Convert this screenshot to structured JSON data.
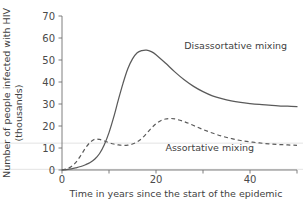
{
  "chart_data": {
    "type": "line",
    "title": "",
    "xlabel": "Time in years since the start of the epidemic",
    "ylabel": "Number of people infected with HIV (thousands)",
    "ylabel_line1": "Number of people infected with HIV",
    "ylabel_line2": "(thousands)",
    "xlim": [
      0,
      50
    ],
    "ylim": [
      0,
      70
    ],
    "xticks": [
      0,
      10,
      20,
      30,
      40,
      50
    ],
    "xtick_labels": [
      "0",
      "",
      "20",
      "",
      "40",
      ""
    ],
    "yticks": [
      0,
      10,
      20,
      30,
      40,
      50,
      60,
      70
    ],
    "ytick_labels": [
      "0",
      "10",
      "20",
      "30",
      "40",
      "50",
      "60",
      "70"
    ],
    "grid": false,
    "legend_position": "inline-annotations",
    "series": [
      {
        "name": "Disassortative mixing",
        "style": "solid",
        "color": "#5a5a5a",
        "label_x": 26,
        "label_y": 55,
        "x": [
          0,
          1,
          2,
          3,
          4,
          5,
          6,
          7,
          8,
          9,
          10,
          11,
          12,
          13,
          14,
          15,
          16,
          17,
          18,
          19,
          20,
          22,
          24,
          26,
          28,
          30,
          32,
          34,
          36,
          38,
          40,
          42,
          44,
          46,
          48,
          50
        ],
        "y": [
          0,
          0.2,
          0.5,
          1.0,
          1.6,
          2.4,
          3.4,
          5.0,
          7.5,
          11.5,
          17.0,
          24.0,
          32.0,
          39.5,
          46.0,
          50.5,
          53.3,
          54.3,
          54.5,
          53.8,
          52.4,
          48.6,
          44.6,
          41.0,
          38.0,
          35.6,
          33.7,
          32.4,
          31.4,
          30.7,
          30.2,
          29.8,
          29.5,
          29.2,
          29.0,
          28.8
        ]
      },
      {
        "name": "Assortative mixing",
        "style": "dashed",
        "color": "#5a5a5a",
        "label_x": 22,
        "label_y": 8.5,
        "x": [
          0,
          1,
          2,
          3,
          4,
          5,
          6,
          7,
          8,
          9,
          10,
          11,
          12,
          13,
          14,
          15,
          16,
          17,
          18,
          19,
          20,
          21,
          22,
          23,
          24,
          26,
          28,
          30,
          32,
          34,
          36,
          38,
          40,
          42,
          44,
          46,
          48,
          50
        ],
        "y": [
          0,
          0.5,
          1.6,
          3.6,
          6.6,
          10.0,
          12.6,
          14.0,
          13.9,
          13.2,
          12.4,
          11.8,
          11.4,
          11.2,
          11.3,
          11.8,
          12.8,
          14.4,
          16.6,
          19.0,
          21.0,
          22.4,
          23.2,
          23.4,
          23.2,
          22.0,
          20.2,
          18.4,
          16.8,
          15.4,
          14.3,
          13.4,
          12.8,
          12.3,
          11.9,
          11.6,
          11.4,
          11.2
        ]
      }
    ]
  },
  "annotations": {
    "disassortative_label": "Disassortative mixing",
    "assortative_label": "Assortative mixing"
  }
}
